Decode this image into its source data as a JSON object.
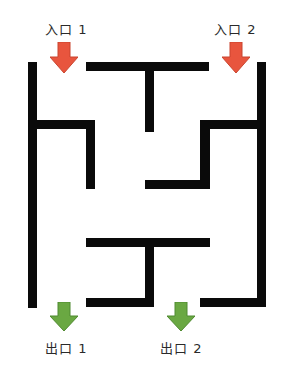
{
  "labels": {
    "entrance_1": "入口 1",
    "entrance_2": "入口 2",
    "exit_1": "出口 1",
    "exit_2": "出口 2"
  },
  "colors": {
    "wall": "#0a0a0a",
    "entrance_arrow": "#e8553e",
    "entrance_arrow_stroke": "#c9452f",
    "exit_arrow": "#6aa842",
    "exit_arrow_stroke": "#4f8a30",
    "background": "#ffffff"
  },
  "arrows": [
    {
      "name": "entrance-1-arrow",
      "direction": "down",
      "kind": "entrance",
      "x": 50,
      "y": 42
    },
    {
      "name": "entrance-2-arrow",
      "direction": "down",
      "kind": "entrance",
      "x": 222,
      "y": 42
    },
    {
      "name": "exit-1-arrow",
      "direction": "down",
      "kind": "exit",
      "x": 50,
      "y": 302
    },
    {
      "name": "exit-2-arrow",
      "direction": "down",
      "kind": "exit",
      "x": 167,
      "y": 302
    }
  ]
}
